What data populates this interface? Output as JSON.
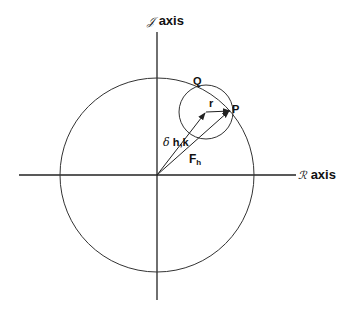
{
  "diagram": {
    "axes": {
      "imaginary": {
        "symbol": "𝒥",
        "label": "axis"
      },
      "real": {
        "symbol": "ℛ",
        "label": "axis"
      }
    },
    "points": {
      "P": "P",
      "Q": "Q"
    },
    "vectors": {
      "delta": {
        "symbol": "δ",
        "label": "h,k"
      },
      "F": {
        "label": "F",
        "subscript": "h"
      },
      "r": {
        "label": "r"
      }
    },
    "colors": {
      "stroke": "#222222",
      "background": "#ffffff"
    }
  }
}
